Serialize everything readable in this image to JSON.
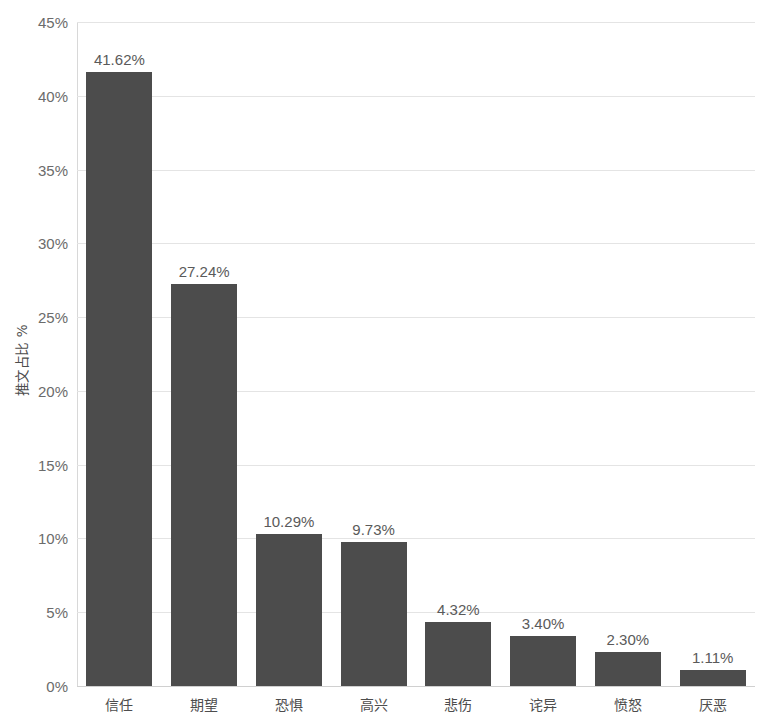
{
  "chart_data": {
    "type": "bar",
    "title": "",
    "subtitle": "",
    "xlabel": "",
    "ylabel": "推文占比 %",
    "categories": [
      "信任",
      "期望",
      "恐惧",
      "高兴",
      "悲伤",
      "诧异",
      "愤怒",
      "厌恶"
    ],
    "values": [
      41.62,
      27.24,
      10.29,
      9.73,
      4.32,
      3.4,
      2.3,
      1.11
    ],
    "value_labels": [
      "41.62%",
      "27.24%",
      "10.29%",
      "9.73%",
      "4.32%",
      "3.40%",
      "2.30%",
      "1.11%"
    ],
    "ylim": [
      0,
      45
    ],
    "ytick_values": [
      0,
      5,
      10,
      15,
      20,
      25,
      30,
      35,
      40,
      45
    ],
    "ytick_labels": [
      "0%",
      "5%",
      "10%",
      "15%",
      "20%",
      "25%",
      "30%",
      "35%",
      "40%",
      "45%"
    ],
    "grid": true,
    "legend": "none",
    "bar_color": "#4c4c4c",
    "gridline_color": "#e4e4e4",
    "text_color": "#5a5a5a",
    "background_color": "#ffffff"
  }
}
